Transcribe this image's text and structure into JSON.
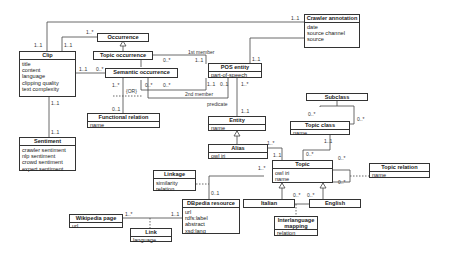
{
  "classes": {
    "clip": {
      "name": "Clip",
      "attrs": [
        "title",
        "content",
        "language",
        "clipping quality",
        "text complexity"
      ]
    },
    "occurrence": {
      "name": "Occurrence"
    },
    "topic_occurrence": {
      "name": "Topic occurrence"
    },
    "semantic_occurrence": {
      "name": "Semantic occurrence"
    },
    "crawler_annotation": {
      "name": "Crawler annotation",
      "attrs": [
        "date",
        "source channel",
        "source",
        "..."
      ]
    },
    "pos_entity": {
      "name": "POS entity",
      "attrs": [
        "part-of-speech"
      ]
    },
    "functional_relation": {
      "name": "Functional relation",
      "attrs": [
        "name"
      ]
    },
    "entity": {
      "name": "Entity",
      "attrs": [
        "name"
      ]
    },
    "sentiment": {
      "name": "Sentiment",
      "attrs": [
        "crawler sentiment",
        "nlp sentiment",
        "crowd sentiment",
        "expert sentiment"
      ]
    },
    "alias": {
      "name": "Alias",
      "attrs": [
        "owl iri"
      ]
    },
    "subclass": {
      "name": "Subclass"
    },
    "topic_class": {
      "name": "Topic class",
      "attrs": [
        "name"
      ]
    },
    "topic": {
      "name": "Topic",
      "attrs": [
        "owl iri",
        "name"
      ]
    },
    "topic_relation": {
      "name": "Topic relation",
      "attrs": [
        "name"
      ]
    },
    "linkage": {
      "name": "Linkage",
      "attrs": [
        "similarity",
        "relation"
      ]
    },
    "dbpedia_resource": {
      "name": "DBpedia resource",
      "attrs": [
        "url",
        "rdfs:label",
        "abstract",
        "xsd:lang"
      ]
    },
    "italian": {
      "name": "Italian"
    },
    "english": {
      "name": "English"
    },
    "wikipedia_page": {
      "name": "Wikipedia page",
      "attrs": [
        "url"
      ]
    },
    "link": {
      "name": "Link",
      "attrs": [
        "language"
      ]
    },
    "interlanguage_mapping": {
      "name": "Interlanguage mapping",
      "attrs": [
        "relation"
      ]
    }
  },
  "labels": {
    "clip_crawler_clip": "1..1",
    "clip_crawler_crawler": "1..1",
    "clip_occ_clip": "1..1",
    "clip_occ_occ": "1..*",
    "clip_sem_clip": "1..1",
    "clip_sem_sem": "0..*",
    "clip_sent_clip": "1..1",
    "clip_sent_sent": "1..1",
    "first_member": "1st member",
    "second_member": "2nd member",
    "sem_first": "0..*",
    "pos_first": "1..1",
    "sem_second": "0..*",
    "pos_second": "1..1",
    "sem_func_sem": "1..*",
    "sem_func_func": "0..1",
    "or": "{OR}",
    "sem_pred": "0..*",
    "pos_pred": "0..1",
    "predicate": "predicate",
    "crawler_pos": "1..1",
    "pos_entity_pos": "1..*",
    "pos_entity_entity": "1..1",
    "alias_topic_alias": "1..*",
    "alias_topic_topic": "1..1",
    "tc_sub_a": "0..*",
    "tc_sub_b": "0..*",
    "tc_topic_tc": "1..1",
    "tc_topic_topic": "0..*",
    "topic_rel_a": "0..*",
    "topic_rel_b": "0..*",
    "topic_dbp_topic": "1..*",
    "topic_dbp_dbp": "0..1",
    "ita_map": "0..*",
    "eng_map": "0..*",
    "wiki_link_wiki": "1..*",
    "wiki_link_dbp": "1..1"
  }
}
